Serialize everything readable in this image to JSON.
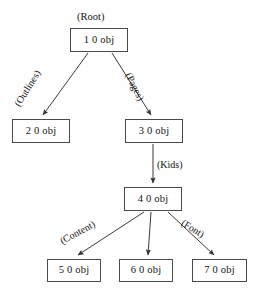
{
  "figure": {
    "title_caption": "(Root)",
    "background_color": "#fefefe",
    "stroke_color": "#4a4a4a",
    "text_color": "#141414"
  },
  "nodes": [
    {
      "id": "n1",
      "label": "1 0 obj"
    },
    {
      "id": "n2",
      "label": "2 0 obj"
    },
    {
      "id": "n3",
      "label": "3 0 obj"
    },
    {
      "id": "n4",
      "label": "4 0 obj"
    },
    {
      "id": "n5",
      "label": "5 0 obj"
    },
    {
      "id": "n6",
      "label": "6 0 obj"
    },
    {
      "id": "n7",
      "label": "7 0 obj"
    }
  ],
  "edges": [
    {
      "from": "1 0 obj",
      "to": "2 0 obj",
      "label": "(Outlines)"
    },
    {
      "from": "1 0 obj",
      "to": "3 0 obj",
      "label": "(Pages)"
    },
    {
      "from": "3 0 obj",
      "to": "4 0 obj",
      "label": "(Kids)"
    },
    {
      "from": "4 0 obj",
      "to": "5 0 obj",
      "label": "(Content)"
    },
    {
      "from": "4 0 obj",
      "to": "6 0 obj",
      "label": ""
    },
    {
      "from": "4 0 obj",
      "to": "7 0 obj",
      "label": "(Font)"
    }
  ]
}
